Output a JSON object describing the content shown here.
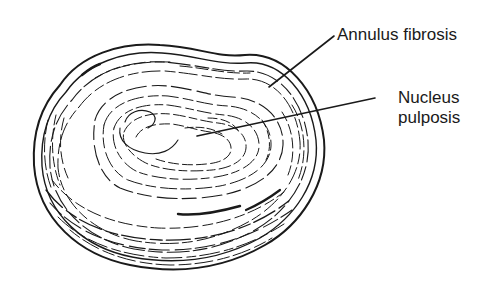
{
  "figure": {
    "labels": [
      {
        "id": "annulus",
        "text": "Annulus fibrosis",
        "leader_from": [
          269,
          87
        ],
        "leader_to": [
          334,
          36
        ]
      },
      {
        "id": "nucleus",
        "line1": "Nucleus",
        "line2": "pulposis",
        "leader_from": [
          197,
          136
        ],
        "leader_to": [
          375,
          98
        ]
      }
    ]
  },
  "colors": {
    "ink": "#1a1a1a",
    "background": "#ffffff"
  }
}
